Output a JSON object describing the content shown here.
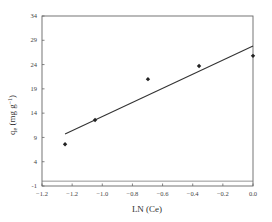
{
  "chart_data": {
    "type": "scatter",
    "title": "",
    "xlabel": "LN (Ce)",
    "ylabel": "qe (mg g-1)",
    "ylabel_parts": {
      "main": "q",
      "sub": "e",
      "rest": " (mg g",
      "sup": "-1",
      "close": ")"
    },
    "xlim": [
      -1.4,
      0.0
    ],
    "ylim": [
      -1,
      34
    ],
    "x_ticks": [
      -1.4,
      -1.2,
      -1.0,
      -0.8,
      -0.6,
      -0.4,
      -0.2,
      0.0
    ],
    "x_tick_labels": [
      "-1.2",
      "-1.2",
      "-1.0",
      "-0.8",
      "-0.6",
      "-0.4",
      "-0.2",
      "0.0"
    ],
    "y_ticks": [
      -1,
      4,
      9,
      14,
      19,
      24,
      29,
      34
    ],
    "y_tick_labels": [
      "-1",
      "4",
      "9",
      "14",
      "19",
      "24",
      "29",
      "34"
    ],
    "grid": false,
    "legend": null,
    "series": [
      {
        "name": "data",
        "marker": "diamond",
        "color": "#222222",
        "x": [
          -1.247,
          -1.048,
          -0.697,
          -0.358,
          0.0
        ],
        "y": [
          7.6,
          12.6,
          21.0,
          23.7,
          25.8
        ]
      },
      {
        "name": "linear fit",
        "type": "line",
        "color": "#333333",
        "x": [
          -1.247,
          0.0
        ],
        "y": [
          9.7,
          27.8
        ]
      }
    ],
    "reference_lines": [
      {
        "orientation": "horizontal",
        "y": 0
      }
    ]
  }
}
